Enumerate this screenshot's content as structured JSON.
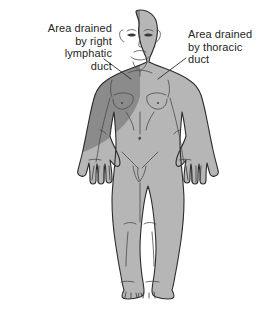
{
  "figure": {
    "name": "lymphatic-drainage-regions",
    "background_color": "#ffffff",
    "width": 280,
    "height": 317
  },
  "labels": {
    "right_lymphatic_duct": {
      "text": "Area drained\nby right\nlymphatic\nduct",
      "align": "right",
      "region_color": "#8b8b8b"
    },
    "thoracic_duct": {
      "text": "Area drained\nby thoracic\nduct",
      "align": "left",
      "region_color": "#b6b6b6"
    }
  },
  "body": {
    "outline_color": "#2b2b2b",
    "dark_region_color": "#8b8b8b",
    "light_region_color": "#b6b6b6",
    "detail_line_color": "#4a4a4a",
    "parts": [
      "head",
      "neck",
      "torso",
      "right-arm",
      "left-arm",
      "right-hand",
      "left-hand",
      "right-leg",
      "left-leg",
      "right-foot",
      "left-foot"
    ]
  },
  "leader_lines": {
    "left_leader": "from right lymphatic duct label to figure right shoulder",
    "right_leader": "from thoracic duct label to figure left shoulder"
  }
}
